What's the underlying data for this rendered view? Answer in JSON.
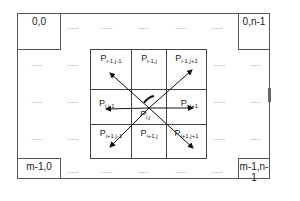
{
  "corners": {
    "top_left": "0,0",
    "top_right": "0,n-1",
    "bottom_left": "m-1,0",
    "bottom_right": "m-1,n-1"
  },
  "ellipsis": ".....",
  "neighborhood": {
    "center_label": "P",
    "center_sub": "i,j",
    "cells": [
      {
        "main": "P",
        "sub": "i-1,j-1"
      },
      {
        "main": "P",
        "sub": "i-1,j"
      },
      {
        "main": "P",
        "sub": "i-1,j+1"
      },
      {
        "main": "P",
        "sub": "i,j-1"
      },
      {
        "main": "",
        "sub": ""
      },
      {
        "main": "P",
        "sub": "i,j+1"
      },
      {
        "main": "P",
        "sub": "i+1,j-1"
      },
      {
        "main": "P",
        "sub": "i+1,j"
      },
      {
        "main": "P",
        "sub": "i+1,j+1"
      }
    ]
  },
  "colors": {
    "lines": "#444444",
    "arrows": "#111111",
    "dots": "#777777"
  }
}
